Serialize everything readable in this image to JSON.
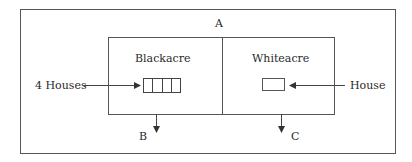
{
  "diagram": {
    "outer_parcel": {
      "label": "A"
    },
    "left_parcel": {
      "label": "Blackacre",
      "houses_count": 4
    },
    "right_parcel": {
      "label": "Whiteacre",
      "houses_count": 1
    },
    "left_input": {
      "label": "4 Houses"
    },
    "right_input": {
      "label": "House"
    },
    "left_output": {
      "label": "B"
    },
    "right_output": {
      "label": "C"
    },
    "colors": {
      "line": "#555555",
      "text": "#2a2a2a",
      "background": "#ffffff"
    }
  }
}
